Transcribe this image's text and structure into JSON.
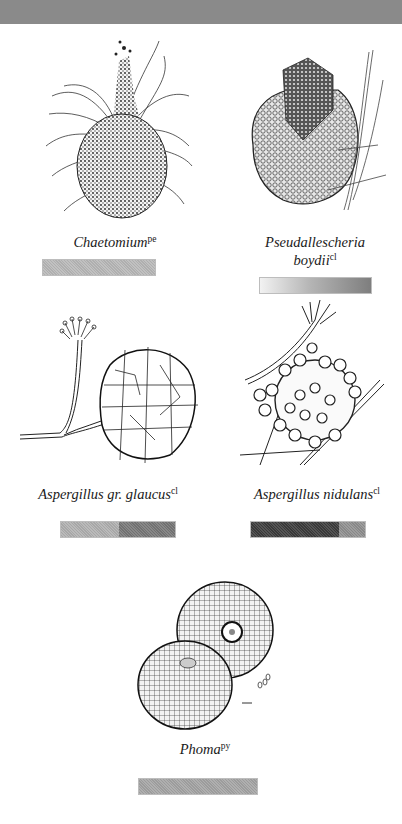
{
  "page": {
    "header_band_color": "#8a8a8a",
    "background": "#ffffff"
  },
  "specimens": [
    {
      "name": "Chaetomium",
      "superscript": "pe",
      "illustration": "chaetomium-perithecium-illustration",
      "bar": {
        "segments": [
          {
            "color": "#b8b8b8",
            "share": 1.0
          }
        ]
      }
    },
    {
      "name_line1": "Pseudallescheria",
      "name_line2": "boydii",
      "superscript": "cl",
      "illustration": "pseudallescheria-cleistothecium-illustration",
      "bar": {
        "gradient": [
          "#f2f2f2",
          "#7e7e7e"
        ]
      }
    },
    {
      "name": "Aspergillus gr. glaucus",
      "superscript": "cl",
      "illustration": "aspergillus-glaucus-cleistothecium-illustration",
      "bar": {
        "segments": [
          {
            "color": "#b0b0b0",
            "share": 0.51
          },
          {
            "color": "#777777",
            "share": 0.49
          }
        ]
      }
    },
    {
      "name": "Aspergillus nidulans",
      "superscript": "cl",
      "illustration": "aspergillus-nidulans-cleistothecium-illustration",
      "bar": {
        "segments": [
          {
            "color": "#3c3c3c",
            "share": 0.77
          },
          {
            "color": "#8f8f8f",
            "share": 0.23
          }
        ]
      }
    },
    {
      "name": "Phoma",
      "superscript": "py",
      "illustration": "phoma-pycnidium-illustration",
      "bar": {
        "segments": [
          {
            "color": "#a4a4a4",
            "share": 1.0
          }
        ]
      }
    }
  ]
}
